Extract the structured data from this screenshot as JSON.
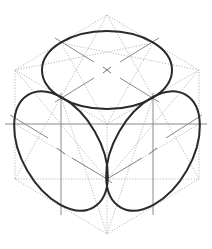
{
  "figure": {
    "title": "",
    "colors": {
      "background": "#ffffff",
      "ellipse_stroke": "#2a2a2a",
      "construction_dotted": "#b8b8b8",
      "center_lines": "#8a8a8a"
    },
    "hexagon": {
      "points": [
        [
          107,
          15
        ],
        [
          199,
          70
        ],
        [
          199,
          179
        ],
        [
          107,
          234
        ],
        [
          15,
          179
        ],
        [
          15,
          70
        ]
      ],
      "center": [
        107,
        124
      ]
    },
    "faces": [
      {
        "name": "top",
        "ellipse_center": [
          107,
          70
        ],
        "rx": 65,
        "ry": 39,
        "rotation": 0
      },
      {
        "name": "left",
        "ellipse_center": [
          61,
          151
        ],
        "rx": 65,
        "ry": 39,
        "rotation": 60
      },
      {
        "name": "right",
        "ellipse_center": [
          153,
          151
        ],
        "rx": 65,
        "ry": 39,
        "rotation": -60
      }
    ],
    "labels": []
  }
}
